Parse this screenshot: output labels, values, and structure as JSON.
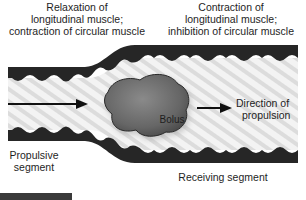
{
  "labels": {
    "top_left": [
      "Relaxation of",
      "longitudinal muscle;",
      "contraction of circular muscle"
    ],
    "top_right": [
      "Contraction of",
      "longitudinal muscle;",
      "inhibition of circular muscle"
    ],
    "direction": [
      "Direction of",
      "propulsion"
    ],
    "propulsive": [
      "Propulsive",
      "segment"
    ],
    "receiving": "Receiving segment",
    "bolus": "Bolus"
  },
  "colors": {
    "wall": "#262626",
    "lumen_light": "#f2f2f2",
    "lumen_stripe": "#d6d6d6",
    "bolus": "#6e6e6e",
    "bolus_outline": "#2a2a2a",
    "arrow": "#111111"
  }
}
